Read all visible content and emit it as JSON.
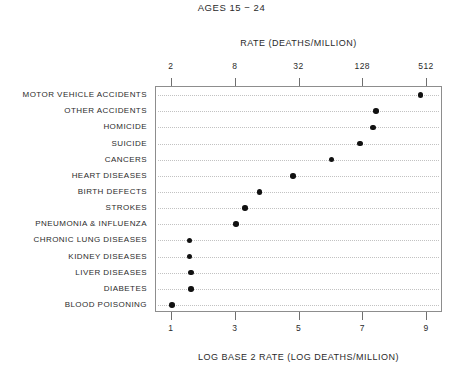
{
  "chart_data": {
    "type": "scatter",
    "title": "AGES 15 − 24",
    "orientation": "horizontal-dotplot",
    "grid": true,
    "legend": null,
    "xlabel": "LOG BASE 2 RATE (LOG DEATHS/MILLION)",
    "top_xlabel": "RATE (DEATHS/MILLION)",
    "ylabel": "",
    "xlim": [
      0.5,
      9.5
    ],
    "bottom_ticks": [
      1,
      3,
      5,
      7,
      9
    ],
    "bottom_tick_labels": [
      "1",
      "3",
      "5",
      "7",
      "9"
    ],
    "top_ticks": [
      1,
      3,
      5,
      7,
      9
    ],
    "top_tick_labels": [
      "2",
      "8",
      "32",
      "128",
      "512"
    ],
    "categories": [
      "MOTOR VEHICLE ACCIDENTS",
      "OTHER ACCIDENTS",
      "HOMICIDE",
      "SUICIDE",
      "CANCERS",
      "HEART DISEASES",
      "BIRTH DEFECTS",
      "STROKES",
      "PNEUMONIA & INFLUENZA",
      "CHRONIC LUNG DISEASES",
      "KIDNEY DISEASES",
      "LIVER DISEASES",
      "DIABETES",
      "BLOOD POISONING"
    ],
    "values": [
      8.8,
      7.4,
      7.3,
      6.9,
      6.0,
      4.8,
      3.75,
      3.3,
      3.0,
      1.55,
      1.55,
      1.6,
      1.6,
      1.0
    ],
    "values_linear_rate": [
      445,
      169,
      158,
      119,
      64,
      28,
      13.5,
      9.8,
      8.0,
      2.9,
      2.9,
      3.0,
      3.0,
      2.0
    ],
    "point_color": "#111111",
    "grid_color": "#c2c2c2",
    "frame_color": "#8d8d8d"
  }
}
